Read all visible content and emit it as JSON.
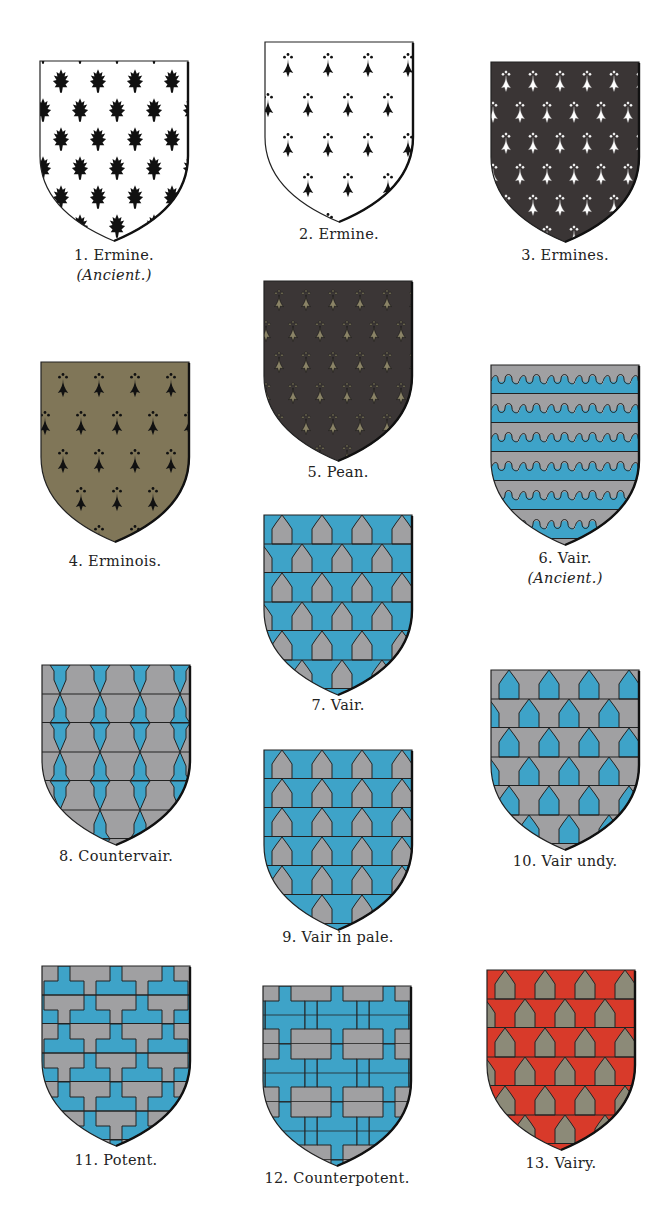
{
  "plate": {
    "title": "Heraldic Furs",
    "colors": {
      "argent": "#ffffff",
      "sable": "#111111",
      "ermines_field": "#3a3535",
      "pean_field": "#3b3636",
      "pean_tail": "#8a8366",
      "erminois_field": "#807658",
      "vair_azure": "#3ea3c8",
      "vair_argent": "#a0a0a2",
      "vairy_gules": "#d83a2a",
      "vairy_or": "#8c8a78",
      "outline": "#1a1a1a"
    },
    "shields": [
      {
        "id": 1,
        "number": "1.",
        "name": "Ermine.",
        "sub": "(Ancient.)",
        "pattern": "ermine-ancient"
      },
      {
        "id": 2,
        "number": "2.",
        "name": "Ermine.",
        "sub": "",
        "pattern": "ermine"
      },
      {
        "id": 3,
        "number": "3.",
        "name": "Ermines.",
        "sub": "",
        "pattern": "ermines"
      },
      {
        "id": 4,
        "number": "4.",
        "name": "Erminois.",
        "sub": "",
        "pattern": "erminois"
      },
      {
        "id": 5,
        "number": "5.",
        "name": "Pean.",
        "sub": "",
        "pattern": "pean"
      },
      {
        "id": 6,
        "number": "6.",
        "name": "Vair.",
        "sub": "(Ancient.)",
        "pattern": "vair-ancient"
      },
      {
        "id": 7,
        "number": "7.",
        "name": "Vair.",
        "sub": "",
        "pattern": "vair"
      },
      {
        "id": 8,
        "number": "8.",
        "name": "Countervair.",
        "sub": "",
        "pattern": "countervair"
      },
      {
        "id": 9,
        "number": "9.",
        "name": "Vair in pale.",
        "sub": "",
        "pattern": "vair-in-pale"
      },
      {
        "id": 10,
        "number": "10.",
        "name": "Vair undy.",
        "sub": "",
        "pattern": "vair-undy"
      },
      {
        "id": 11,
        "number": "11.",
        "name": "Potent.",
        "sub": "",
        "pattern": "potent"
      },
      {
        "id": 12,
        "number": "12.",
        "name": "Counterpotent.",
        "sub": "",
        "pattern": "counterpotent"
      },
      {
        "id": 13,
        "number": "13.",
        "name": "Vairy.",
        "sub": "",
        "pattern": "vairy"
      }
    ]
  }
}
